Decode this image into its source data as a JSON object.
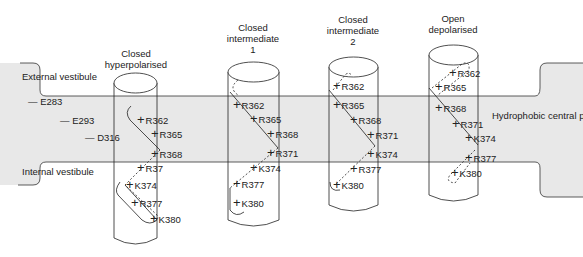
{
  "membrane": {
    "external_label": "External vestibule",
    "internal_label": "Internal vestibule",
    "pore_label": "Hydrophobic central pore",
    "fill_color": "#e6e6e6"
  },
  "acidic_residues": [
    {
      "label": "E283",
      "x": 28,
      "y": 97
    },
    {
      "label": "E293",
      "x": 43,
      "y": 116
    },
    {
      "label": "D316",
      "x": 85,
      "y": 133
    }
  ],
  "states": [
    {
      "title_lines": [
        "Closed",
        "hyperpolarised"
      ],
      "residues": [
        {
          "label": "R362",
          "x": 137,
          "y": 115
        },
        {
          "label": "R365",
          "x": 151,
          "y": 129
        },
        {
          "label": "R368",
          "x": 151,
          "y": 149
        },
        {
          "label": "R37",
          "x": 137,
          "y": 163
        },
        {
          "label": "K374",
          "x": 126,
          "y": 180
        },
        {
          "label": "R377",
          "x": 131,
          "y": 198
        },
        {
          "label": "K380",
          "x": 150,
          "y": 214
        }
      ]
    },
    {
      "title_lines": [
        "Closed",
        "intermediate",
        "1"
      ],
      "residues": [
        {
          "label": "R362",
          "x": 233,
          "y": 100
        },
        {
          "label": "R365",
          "x": 250,
          "y": 114
        },
        {
          "label": "R368",
          "x": 267,
          "y": 129
        },
        {
          "label": "R371",
          "x": 267,
          "y": 148
        },
        {
          "label": "K374",
          "x": 250,
          "y": 163
        },
        {
          "label": "R377",
          "x": 233,
          "y": 179
        },
        {
          "label": "K380",
          "x": 233,
          "y": 198
        }
      ]
    },
    {
      "title_lines": [
        "Closed",
        "intermediate",
        "2"
      ],
      "residues": [
        {
          "label": "R362",
          "x": 333,
          "y": 81
        },
        {
          "label": "R365",
          "x": 333,
          "y": 100
        },
        {
          "label": "R368",
          "x": 350,
          "y": 115
        },
        {
          "label": "R371",
          "x": 367,
          "y": 130
        },
        {
          "label": "K374",
          "x": 367,
          "y": 149
        },
        {
          "label": "R377",
          "x": 350,
          "y": 164
        },
        {
          "label": "K380",
          "x": 333,
          "y": 180
        }
      ]
    },
    {
      "title_lines": [
        "Open",
        "depolarised"
      ],
      "residues": [
        {
          "label": "R362",
          "x": 449,
          "y": 68
        },
        {
          "label": "R365",
          "x": 435,
          "y": 82
        },
        {
          "label": "R368",
          "x": 435,
          "y": 103
        },
        {
          "label": "R371",
          "x": 452,
          "y": 119
        },
        {
          "label": "K374",
          "x": 465,
          "y": 133
        },
        {
          "label": "R377",
          "x": 465,
          "y": 153
        },
        {
          "label": "K380",
          "x": 451,
          "y": 168
        }
      ]
    }
  ]
}
